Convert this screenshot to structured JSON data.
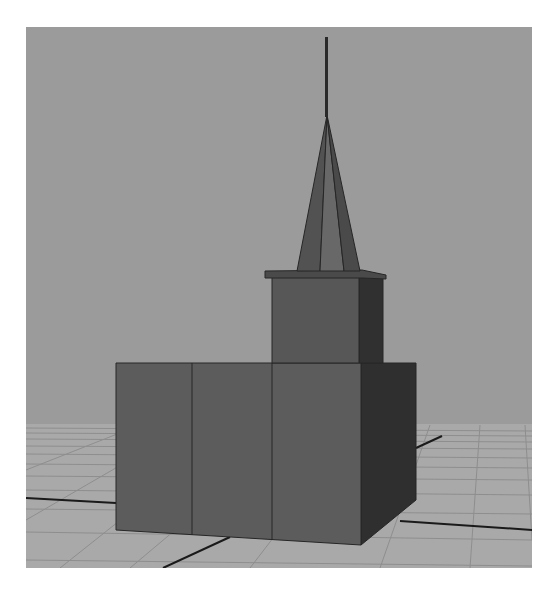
{
  "viewport": {
    "label": "3D perspective viewport",
    "scene": "Church model with steeple on a ground grid",
    "colors": {
      "background": "#9b9b9b",
      "grid_floor": "#a9a9a9",
      "grid_line": "#8e8e8e",
      "axis_line": "#1a1a1a",
      "front_face": "#5c5c5c",
      "side_face": "#2f2f2f",
      "tower_front": "#575757",
      "tower_side": "#303030",
      "spire_left": "#525252",
      "spire_mid": "#686868",
      "spire_right": "#4a4a4a",
      "pole": "#2a2a2a",
      "edge": "#262626"
    }
  },
  "objects": [
    {
      "name": "main-block",
      "type": "box",
      "front_panels": 3
    },
    {
      "name": "bell-tower",
      "type": "box"
    },
    {
      "name": "tower-cornice",
      "type": "slab"
    },
    {
      "name": "spire",
      "type": "pyramid"
    },
    {
      "name": "finial-pole",
      "type": "cylinder"
    }
  ]
}
